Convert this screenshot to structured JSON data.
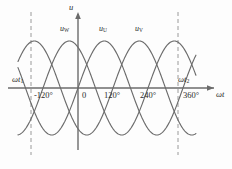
{
  "figure": {
    "background": "#fdfdfd"
  },
  "axes": {
    "y_axis_label": "u",
    "x_axis_label": "ωt",
    "axis_color": "#6b6b6b",
    "origin_label": "0"
  },
  "ticks": [
    {
      "label": "-120°",
      "value": -120,
      "x": 43
    },
    {
      "label": "0",
      "value": 0,
      "x": 78
    },
    {
      "label": "120°",
      "value": 120,
      "x": 113
    },
    {
      "label": "240°",
      "value": 240,
      "x": 148
    },
    {
      "label": "360°",
      "value": 360,
      "x": 183
    }
  ],
  "markers": [
    {
      "name": "omega-t-1",
      "label": "ωt",
      "sub": "1",
      "value": -135,
      "x": 31
    },
    {
      "name": "omega-t-2",
      "label": "ωt",
      "sub": "2",
      "value": 343,
      "x": 178
    }
  ],
  "curve_labels": [
    {
      "name": "u-W",
      "label": "u",
      "sub": "W",
      "x": 62,
      "y": 26
    },
    {
      "name": "u-U",
      "label": "u",
      "sub": "U",
      "x": 100,
      "y": 26
    },
    {
      "name": "u-V",
      "label": "u",
      "sub": "V",
      "x": 136,
      "y": 26
    }
  ],
  "chart_data": {
    "type": "line",
    "xlabel": "ωt",
    "ylabel": "u",
    "xlim": [
      -160,
      395
    ],
    "ylim": [
      -1.12,
      1.12
    ],
    "x_unit": "degrees",
    "grid": false,
    "legend": "inline-curve-labels",
    "amplitude": 1.0,
    "period_degrees": 360,
    "tick_values": [
      -120,
      0,
      120,
      240,
      360
    ],
    "tick_labels": [
      "-120°",
      "0",
      "120°",
      "240°",
      "360°"
    ],
    "annotations": [
      {
        "text": "ωt₁",
        "x": -135,
        "type": "vertical-dashed-line"
      },
      {
        "text": "ωt₂",
        "x": 343,
        "type": "vertical-dashed-line"
      }
    ],
    "series": [
      {
        "name": "u_U",
        "label": "uᵤ",
        "phase_degrees": 0,
        "color": "#6b6b6b",
        "formula": "u_U = Um*sin(wt)",
        "peak_degrees": [
          90,
          450
        ],
        "zero_crossings_degrees": [
          -180,
          0,
          180,
          360
        ]
      },
      {
        "name": "u_V",
        "label": "uᵥ",
        "phase_degrees": -120,
        "color": "#6b6b6b",
        "formula": "u_V = Um*sin(wt - 120°)",
        "peak_degrees": [
          210
        ],
        "zero_crossings_degrees": [
          -120,
          120,
          300
        ]
      },
      {
        "name": "u_W",
        "label": "u_W",
        "phase_degrees": 120,
        "color": "#6b6b6b",
        "formula": "u_W = Um*sin(wt + 120°)",
        "peak_degrees": [
          -30,
          330
        ],
        "zero_crossings_degrees": [
          -240,
          -120,
          60,
          240
        ]
      }
    ]
  },
  "colors": {
    "curve": "#6b6b6b",
    "axis": "#6b6b6b",
    "dashed_marker": "#9a9a9a",
    "text": "#2b2b2b",
    "background": "#fdfdfd"
  }
}
